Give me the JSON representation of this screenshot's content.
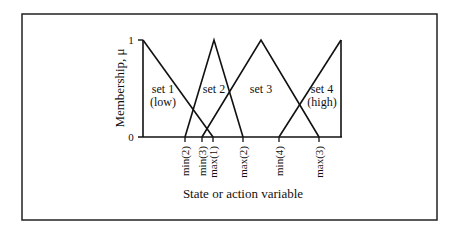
{
  "figure": {
    "y_axis_label": "Membership, μ",
    "x_axis_label": "State or action variable",
    "y_ticks": [
      {
        "label": "1",
        "value": 1
      },
      {
        "label": "0",
        "value": 0
      }
    ],
    "x_ticks": [
      {
        "label": "min(2)"
      },
      {
        "label": "min(3)"
      },
      {
        "label": "max(1)"
      },
      {
        "label": "max(2)"
      },
      {
        "label": "min(4)"
      },
      {
        "label": "max(3)"
      }
    ],
    "sets": [
      {
        "name": "set 1",
        "sub": "(low)"
      },
      {
        "name": "set 2",
        "sub": ""
      },
      {
        "name": "set 3",
        "sub": ""
      },
      {
        "name": "set 4",
        "sub": "(high)"
      }
    ]
  },
  "colors": {
    "line": "#111111",
    "border": "#222222",
    "background": "#ffffff"
  }
}
